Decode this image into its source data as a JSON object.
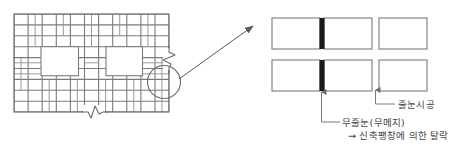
{
  "figure": {
    "type": "construction-detail-drawing",
    "title": ""
  },
  "colors": {
    "line": "#6b6b6b",
    "line_light": "#8c8c8c",
    "joint_dark": "#1a1a1a",
    "text": "#444444",
    "background": "#ffffff"
  },
  "left_panel": {
    "name": "tile-wall-elevation",
    "grid": {
      "columns": 11,
      "rows": 9,
      "x": 14,
      "y": 14,
      "width": 155,
      "height": 98,
      "cell_w": 14.1,
      "cell_h": 10.9
    },
    "openings": [
      {
        "name": "opening-left",
        "x": 41,
        "y": 46,
        "w": 37,
        "h": 29
      },
      {
        "name": "opening-right",
        "x": 106,
        "y": 46,
        "w": 36,
        "h": 29
      }
    ],
    "break_symbols": [
      {
        "name": "break-symbol-right",
        "orientation": "vertical",
        "x": 168,
        "y": 57
      },
      {
        "name": "break-symbol-bottom",
        "orientation": "horizontal",
        "x": 93,
        "y": 111
      }
    ],
    "detail_circle": {
      "name": "detail-callout-circle",
      "cx": 164,
      "cy": 82,
      "r": 16
    },
    "pointer_arrow": {
      "name": "callout-arrow",
      "x1": 178,
      "y1": 80,
      "x2": 256,
      "y2": 28
    }
  },
  "right_panel": {
    "name": "tile-joint-detail",
    "rows": [
      {
        "name": "detail-row-top",
        "tiles": [
          {
            "name": "tile-top-left",
            "x": 272,
            "y": 18,
            "w": 48,
            "h": 31
          },
          {
            "name": "tile-top-mid",
            "x": 324,
            "y": 18,
            "w": 48,
            "h": 31
          },
          {
            "name": "tile-top-right",
            "x": 379,
            "y": 18,
            "w": 48,
            "h": 31
          }
        ],
        "joint": {
          "name": "joint-bar-top",
          "x": 319,
          "y": 18,
          "w": 5,
          "h": 31
        }
      },
      {
        "name": "detail-row-bottom",
        "tiles": [
          {
            "name": "tile-bottom-left",
            "x": 272,
            "y": 60,
            "w": 48,
            "h": 31
          },
          {
            "name": "tile-bottom-mid",
            "x": 324,
            "y": 60,
            "w": 48,
            "h": 31
          },
          {
            "name": "tile-bottom-right",
            "x": 379,
            "y": 60,
            "w": 48,
            "h": 31
          }
        ],
        "joint": {
          "name": "joint-bar-bottom",
          "x": 319,
          "y": 60,
          "w": 5,
          "h": 31
        }
      }
    ],
    "leaders": [
      {
        "name": "leader-joint",
        "label_key": "joint",
        "tick_x": 375,
        "tick_y0": 88,
        "tick_y1": 99,
        "elbow_x0": 375,
        "elbow_x1": 395,
        "elbow_y": 104
      },
      {
        "name": "leader-nojoint",
        "label_key": "nojoint",
        "tick_x": 321,
        "tick_y0": 91,
        "tick_y1": 103,
        "elbow_x0": 321,
        "elbow_x1": 339,
        "elbow_y": 122
      }
    ]
  },
  "labels": {
    "joint": "줄눈시공",
    "nojoint": "무줄눈(무메지)",
    "result": "→ 신축팽창에 의한 탈락"
  }
}
